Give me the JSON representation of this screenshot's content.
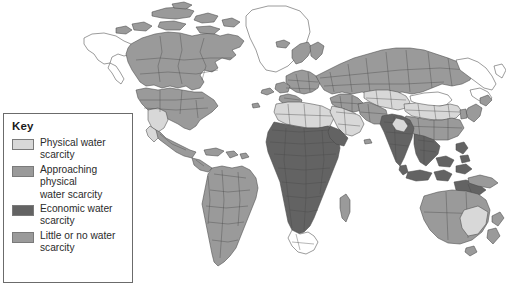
{
  "map": {
    "title": "World water scarcity map",
    "background_color": "#ffffff",
    "outline_color": "#4a4a4a",
    "unshaded_color": "#ffffff",
    "categories": [
      {
        "id": "physical-water-scarcity",
        "label": "Physical water\nscarcity",
        "color": "#d8d8d8"
      },
      {
        "id": "approaching-physical-water-scarcity",
        "label": "Approaching\nphysical\nwater scarcity",
        "color": "#9a9a9a"
      },
      {
        "id": "economic-water-scarcity",
        "label": "Economic water\nscarcity",
        "color": "#636363"
      },
      {
        "id": "little-or-no-water-scarcity",
        "label": "Little or no water\nscarcity",
        "color": "#9a9a9a"
      }
    ]
  },
  "legend": {
    "title": "Key",
    "border_color": "#6b6b6b",
    "items": [
      {
        "swatch_color": "#d8d8d8",
        "label": "Physical water\nscarcity"
      },
      {
        "swatch_color": "#9a9a9a",
        "label": "Approaching\nphysical\nwater scarcity"
      },
      {
        "swatch_color": "#636363",
        "label": "Economic water\nscarcity"
      },
      {
        "swatch_color": "#9a9a9a",
        "label": "Little or no water\nscarcity"
      }
    ]
  },
  "regions": [
    {
      "name": "Greenland",
      "category": "unshaded"
    },
    {
      "name": "Alaska",
      "category": "unshaded"
    },
    {
      "name": "Canada",
      "category": "approaching-physical-water-scarcity"
    },
    {
      "name": "United States",
      "category": "approaching-physical-water-scarcity"
    },
    {
      "name": "Southwestern United States",
      "category": "physical-water-scarcity"
    },
    {
      "name": "Mexico",
      "category": "approaching-physical-water-scarcity"
    },
    {
      "name": "Central America",
      "category": "approaching-physical-water-scarcity"
    },
    {
      "name": "South America",
      "category": "approaching-physical-water-scarcity"
    },
    {
      "name": "Europe",
      "category": "approaching-physical-water-scarcity"
    },
    {
      "name": "Russia",
      "category": "approaching-physical-water-scarcity"
    },
    {
      "name": "North Africa",
      "category": "physical-water-scarcity"
    },
    {
      "name": "Sub-Saharan Africa",
      "category": "economic-water-scarcity"
    },
    {
      "name": "South Africa",
      "category": "unshaded"
    },
    {
      "name": "Madagascar",
      "category": "approaching-physical-water-scarcity"
    },
    {
      "name": "Arabian Peninsula",
      "category": "physical-water-scarcity"
    },
    {
      "name": "Middle East",
      "category": "approaching-physical-water-scarcity"
    },
    {
      "name": "Central Asia",
      "category": "physical-water-scarcity"
    },
    {
      "name": "Mongolia",
      "category": "unshaded"
    },
    {
      "name": "Northern China",
      "category": "physical-water-scarcity"
    },
    {
      "name": "Southern China",
      "category": "approaching-physical-water-scarcity"
    },
    {
      "name": "India",
      "category": "economic-water-scarcity"
    },
    {
      "name": "Southeast Asia",
      "category": "economic-water-scarcity"
    },
    {
      "name": "Indonesia",
      "category": "economic-water-scarcity"
    },
    {
      "name": "Japan",
      "category": "approaching-physical-water-scarcity"
    },
    {
      "name": "Australia",
      "category": "approaching-physical-water-scarcity"
    },
    {
      "name": "Southeastern Australia",
      "category": "physical-water-scarcity"
    },
    {
      "name": "New Zealand",
      "category": "approaching-physical-water-scarcity"
    }
  ]
}
